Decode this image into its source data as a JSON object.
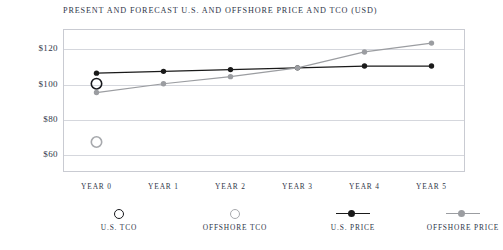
{
  "chart_data": {
    "type": "line",
    "title": "PRESENT AND FORECAST U.S. AND OFFSHORE PRICE AND TCO (USD)",
    "xlabel": "",
    "ylabel": "",
    "categories": [
      "YEAR 0",
      "YEAR 1",
      "YEAR 2",
      "YEAR 3",
      "YEAR 4",
      "YEAR 5"
    ],
    "ylim": [
      50,
      131
    ],
    "yticks": [
      60,
      80,
      100,
      120
    ],
    "ytick_labels": [
      "$60",
      "$80",
      "$100",
      "$120"
    ],
    "grid": true,
    "legend_position": "bottom",
    "series": [
      {
        "name": "U.S. TCO",
        "type": "scatter",
        "marker": "open-circle",
        "color": "#17181c",
        "x": [
          "YEAR 0"
        ],
        "values": [
          100
        ]
      },
      {
        "name": "OFFSHORE TCO",
        "type": "scatter",
        "marker": "open-circle",
        "color": "#a7a9ad",
        "x": [
          "YEAR 0"
        ],
        "values": [
          67
        ]
      },
      {
        "name": "U.S. PRICE",
        "type": "line",
        "marker": "filled-circle",
        "color": "#1a1a1a",
        "values": [
          106,
          107,
          108,
          109,
          110,
          110
        ]
      },
      {
        "name": "OFFSHORE PRICE",
        "type": "line",
        "marker": "filled-circle",
        "color": "#9b9da1",
        "values": [
          95,
          100,
          104,
          109,
          118,
          123
        ]
      }
    ]
  },
  "legend": {
    "items": [
      {
        "label": "U.S. TCO",
        "marker": "open-circle-dark"
      },
      {
        "label": "OFFSHORE TCO",
        "marker": "open-circle-light"
      },
      {
        "label": "U.S. PRICE",
        "marker": "line-dot-dark"
      },
      {
        "label": "OFFSHORE PRICE",
        "marker": "line-dot-light"
      }
    ]
  },
  "colors": {
    "title": "#2f3649",
    "frame": "#c9cbd2",
    "grid": "#d5d7dd",
    "us_dark": "#1a1a1a",
    "offshore_gray": "#9b9da1"
  }
}
